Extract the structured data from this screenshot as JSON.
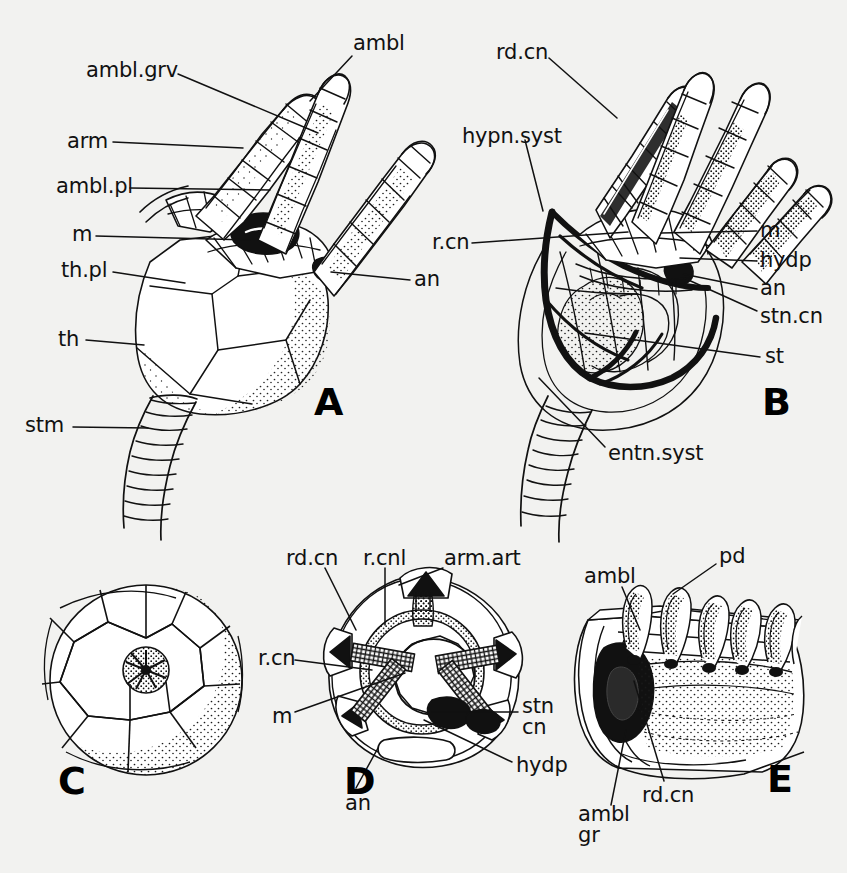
{
  "figure": {
    "background_color": "#f2f2f0",
    "ink_color": "#111111"
  },
  "panels": [
    {
      "id": "A",
      "letter": "A",
      "x": 314,
      "y": 383
    },
    {
      "id": "B",
      "letter": "B",
      "x": 762,
      "y": 383
    },
    {
      "id": "C",
      "letter": "C",
      "x": 58,
      "y": 762
    },
    {
      "id": "D",
      "letter": "D",
      "x": 344,
      "y": 762
    },
    {
      "id": "E",
      "letter": "E",
      "x": 767,
      "y": 760
    }
  ],
  "labels": {
    "panel_a": [
      {
        "name": "ambl-grv",
        "text": "ambl.grv",
        "x": 86,
        "y": 60,
        "align": "left",
        "leader": [
          [
            178,
            74
          ],
          [
            318,
            133
          ]
        ]
      },
      {
        "name": "ambl",
        "text": "ambl",
        "x": 353,
        "y": 33,
        "align": "left",
        "leader": [
          [
            352,
            56
          ],
          [
            310,
            101
          ]
        ]
      },
      {
        "name": "arm",
        "text": "arm",
        "x": 67,
        "y": 131,
        "align": "left",
        "leader": [
          [
            113,
            142
          ],
          [
            243,
            148
          ]
        ]
      },
      {
        "name": "ambl-pl",
        "text": "ambl.pl",
        "x": 56,
        "y": 176,
        "align": "left",
        "leader": [
          [
            130,
            188
          ],
          [
            270,
            190
          ]
        ]
      },
      {
        "name": "m",
        "text": "m",
        "x": 72,
        "y": 224,
        "align": "left",
        "leader": [
          [
            96,
            236
          ],
          [
            250,
            240
          ]
        ]
      },
      {
        "name": "th-pl",
        "text": "th.pl",
        "x": 61,
        "y": 260,
        "align": "left",
        "leader": [
          [
            113,
            272
          ],
          [
            185,
            283
          ]
        ]
      },
      {
        "name": "an",
        "text": "an",
        "x": 414,
        "y": 269,
        "align": "left",
        "leader": [
          [
            410,
            280
          ],
          [
            331,
            272
          ]
        ]
      },
      {
        "name": "th",
        "text": "th",
        "x": 58,
        "y": 329,
        "align": "left",
        "leader": [
          [
            86,
            340
          ],
          [
            144,
            345
          ]
        ]
      },
      {
        "name": "stm",
        "text": "stm",
        "x": 25,
        "y": 415,
        "align": "left",
        "leader": [
          [
            73,
            427
          ],
          [
            148,
            428
          ]
        ]
      }
    ],
    "panel_b": [
      {
        "name": "rd-cn",
        "text": "rd.cn",
        "x": 496,
        "y": 42,
        "align": "left",
        "leader": [
          [
            549,
            58
          ],
          [
            617,
            118
          ]
        ]
      },
      {
        "name": "hypn-syst",
        "text": "hypn.syst",
        "x": 462,
        "y": 126,
        "align": "left",
        "leader": [
          [
            525,
            140
          ],
          [
            543,
            211
          ]
        ]
      },
      {
        "name": "r-cn",
        "text": "r.cn",
        "x": 432,
        "y": 232,
        "align": "left",
        "leader": [
          [
            472,
            243
          ],
          [
            628,
            232
          ]
        ]
      },
      {
        "name": "m",
        "text": "m",
        "x": 760,
        "y": 220,
        "align": "left",
        "leader": [
          [
            757,
            231
          ],
          [
            661,
            233
          ]
        ]
      },
      {
        "name": "hydp",
        "text": "hydp",
        "x": 760,
        "y": 250,
        "align": "left",
        "leader": [
          [
            757,
            261
          ],
          [
            680,
            258
          ]
        ]
      },
      {
        "name": "an",
        "text": "an",
        "x": 760,
        "y": 278,
        "align": "left",
        "leader": [
          [
            757,
            289
          ],
          [
            683,
            274
          ]
        ]
      },
      {
        "name": "stn-cn",
        "text": "stn.cn",
        "x": 760,
        "y": 306,
        "align": "left",
        "leader": [
          [
            757,
            311
          ],
          [
            684,
            278
          ]
        ]
      },
      {
        "name": "st",
        "text": "st",
        "x": 765,
        "y": 346,
        "align": "left",
        "leader": [
          [
            760,
            357
          ],
          [
            585,
            333
          ]
        ]
      },
      {
        "name": "entn-syst",
        "text": "entn.syst",
        "x": 608,
        "y": 443,
        "align": "left",
        "leader": [
          [
            605,
            447
          ],
          [
            539,
            378
          ]
        ]
      }
    ],
    "panel_c": [],
    "panel_d": [
      {
        "name": "rd-cn",
        "text": "rd.cn",
        "x": 286,
        "y": 548,
        "align": "left",
        "leader": [
          [
            325,
            568
          ],
          [
            356,
            630
          ]
        ]
      },
      {
        "name": "r-cnl",
        "text": "r.cnl",
        "x": 363,
        "y": 548,
        "align": "left",
        "leader": [
          [
            385,
            568
          ],
          [
            385,
            625
          ]
        ]
      },
      {
        "name": "arm-art",
        "text": "arm.art",
        "x": 444,
        "y": 548,
        "align": "left",
        "leader": [
          [
            443,
            568
          ],
          [
            399,
            585
          ]
        ]
      },
      {
        "name": "r-cn",
        "text": "r.cn",
        "x": 258,
        "y": 648,
        "align": "left",
        "leader": [
          [
            295,
            660
          ],
          [
            372,
            670
          ]
        ]
      },
      {
        "name": "m",
        "text": "m",
        "x": 272,
        "y": 706,
        "align": "left",
        "leader": [
          [
            295,
            712
          ],
          [
            405,
            673
          ]
        ]
      },
      {
        "name": "stn-cn",
        "text": "stn\ncn",
        "x": 522,
        "y": 696,
        "align": "left",
        "leader": [
          [
            518,
            712
          ],
          [
            432,
            712
          ]
        ]
      },
      {
        "name": "hydp",
        "text": "hydp",
        "x": 516,
        "y": 755,
        "align": "left",
        "leader": [
          [
            512,
            762
          ],
          [
            424,
            720
          ]
        ]
      },
      {
        "name": "an",
        "text": "an",
        "x": 345,
        "y": 793,
        "align": "left",
        "leader": [
          [
            356,
            788
          ],
          [
            378,
            748
          ]
        ]
      }
    ],
    "panel_e": [
      {
        "name": "ambl",
        "text": "ambl",
        "x": 584,
        "y": 566,
        "align": "left",
        "leader": [
          [
            622,
            587
          ],
          [
            640,
            630
          ]
        ]
      },
      {
        "name": "pd",
        "text": "pd",
        "x": 719,
        "y": 546,
        "align": "left",
        "leader": [
          [
            716,
            564
          ],
          [
            673,
            594
          ]
        ]
      },
      {
        "name": "rd-cn",
        "text": "rd.cn",
        "x": 642,
        "y": 785,
        "align": "left",
        "leader": [
          [
            664,
            781
          ],
          [
            634,
            681
          ]
        ]
      },
      {
        "name": "ambl-gr",
        "text": "ambl\ngr",
        "x": 578,
        "y": 804,
        "align": "left",
        "leader": [
          [
            611,
            805
          ],
          [
            626,
            730
          ]
        ]
      }
    ]
  },
  "abbreviations": [
    {
      "key": "ambl",
      "meaning": "ambulacral"
    },
    {
      "key": "ambl.grv",
      "meaning": "ambulacral groove"
    },
    {
      "key": "ambl.pl",
      "meaning": "ambulacral plate"
    },
    {
      "key": "ambl gr",
      "meaning": "ambulacral groove"
    },
    {
      "key": "an",
      "meaning": "anus"
    },
    {
      "key": "arm",
      "meaning": "arm"
    },
    {
      "key": "arm.art",
      "meaning": "arm articulation"
    },
    {
      "key": "entn.syst",
      "meaning": "entoneural system"
    },
    {
      "key": "hydp",
      "meaning": "hydropore"
    },
    {
      "key": "hypn.syst",
      "meaning": "hyponeural system"
    },
    {
      "key": "m",
      "meaning": "mouth"
    },
    {
      "key": "pd",
      "meaning": "podium"
    },
    {
      "key": "r.cn",
      "meaning": "ring canal"
    },
    {
      "key": "r.cnl",
      "meaning": "radial canal"
    },
    {
      "key": "rd.cn",
      "meaning": "radial canal"
    },
    {
      "key": "st",
      "meaning": "stomach"
    },
    {
      "key": "stm",
      "meaning": "stem"
    },
    {
      "key": "stn.cn",
      "meaning": "stone canal"
    },
    {
      "key": "th",
      "meaning": "theca"
    },
    {
      "key": "th.pl",
      "meaning": "thecal plate"
    }
  ]
}
